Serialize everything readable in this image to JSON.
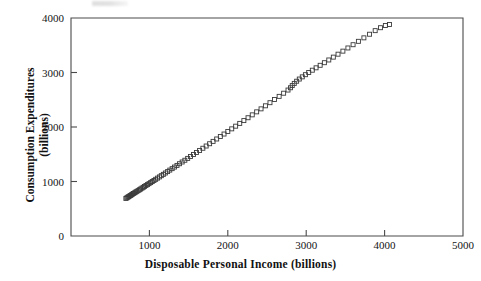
{
  "figure": {
    "background_color": "#ffffff",
    "frame_color": "#4a4a4a",
    "marker_color": "#3a3a3a",
    "text_color": "#141414"
  },
  "chart_data": {
    "type": "scatter",
    "title": "",
    "xlabel": "Disposable Personal Income (billions)",
    "ylabel": "Consumption Expenditures (billions)",
    "ylabel_line1": "Consumption Expenditures",
    "ylabel_line2": "(billions)",
    "xlim": [
      0,
      5000
    ],
    "ylim": [
      0,
      4000
    ],
    "xticks": [
      0,
      1000,
      2000,
      3000,
      4000,
      5000
    ],
    "xticklabels": [
      "0",
      "1000",
      "2000",
      "3000",
      "4000",
      "5000"
    ],
    "yticks": [
      0,
      1000,
      2000,
      3000,
      4000
    ],
    "yticklabels": [
      "0",
      "1000",
      "2000",
      "3000",
      "4000"
    ],
    "xtick_labels_shown": [
      "1000",
      "2000",
      "3000",
      "4000",
      "5000"
    ],
    "grid": false,
    "legend": null,
    "marker": "open-square",
    "marker_size": 4,
    "series": [
      {
        "name": "Consumption vs Disposable Income",
        "x": [
          700,
          712,
          724,
          735,
          748,
          760,
          772,
          784,
          797,
          812,
          826,
          840,
          856,
          872,
          888,
          905,
          921,
          938,
          956,
          975,
          995,
          1016,
          1036,
          1058,
          1080,
          1104,
          1128,
          1152,
          1178,
          1204,
          1232,
          1260,
          1290,
          1320,
          1352,
          1384,
          1418,
          1452,
          1488,
          1524,
          1562,
          1600,
          1640,
          1682,
          1724,
          1768,
          1812,
          1858,
          1905,
          1952,
          2000,
          2050,
          2100,
          2152,
          2205,
          2258,
          2312,
          2368,
          2424,
          2480,
          2538,
          2596,
          2655,
          2712,
          2768,
          2800,
          2822,
          2848,
          2878,
          2912,
          2950,
          2990,
          3032,
          3078,
          3126,
          3178,
          3232,
          3288,
          3346,
          3406,
          3468,
          3532,
          3598,
          3666,
          3736,
          3808,
          3880,
          3948,
          4010,
          4062
        ],
        "y": [
          690,
          700,
          712,
          722,
          734,
          745,
          756,
          768,
          780,
          793,
          806,
          819,
          833,
          848,
          862,
          878,
          893,
          909,
          926,
          943,
          961,
          980,
          999,
          1019,
          1040,
          1062,
          1084,
          1107,
          1131,
          1156,
          1182,
          1209,
          1236,
          1265,
          1295,
          1326,
          1358,
          1390,
          1424,
          1459,
          1495,
          1532,
          1570,
          1610,
          1651,
          1693,
          1736,
          1780,
          1825,
          1871,
          1918,
          1966,
          2015,
          2066,
          2118,
          2170,
          2223,
          2278,
          2333,
          2389,
          2446,
          2504,
          2562,
          2620,
          2678,
          2720,
          2760,
          2800,
          2840,
          2880,
          2920,
          2960,
          3000,
          3042,
          3086,
          3132,
          3180,
          3230,
          3282,
          3336,
          3392,
          3450,
          3510,
          3572,
          3636,
          3702,
          3768,
          3822,
          3862,
          3880
        ]
      }
    ]
  }
}
